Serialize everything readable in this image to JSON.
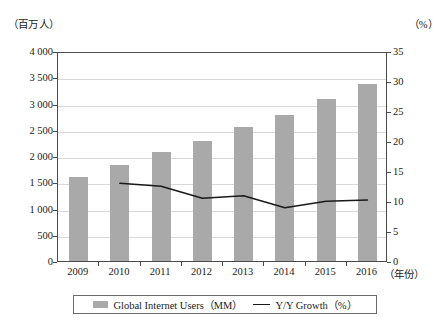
{
  "chart_data": {
    "type": "bar",
    "title": "",
    "xlabel": "年份",
    "ylabel": "（百万人）",
    "y2label": "（%）",
    "categories": [
      "2009",
      "2010",
      "2011",
      "2012",
      "2013",
      "2014",
      "2015",
      "2016"
    ],
    "grid": true,
    "legend_position": "bottom",
    "ylim": [
      0,
      4000
    ],
    "y2lim": [
      0,
      35
    ],
    "yticks": [
      "0",
      "500",
      "1 000",
      "1 500",
      "2 000",
      "2 500",
      "3 000",
      "3 500",
      "4 000"
    ],
    "ytick_values": [
      0,
      500,
      1000,
      1500,
      2000,
      2500,
      3000,
      3500,
      4000
    ],
    "y2ticks": [
      "0",
      "5",
      "10",
      "15",
      "20",
      "25",
      "30",
      "35"
    ],
    "y2tick_values": [
      0,
      5,
      10,
      15,
      20,
      25,
      30,
      35
    ],
    "series": [
      {
        "name": "Global Internet Users（MM）",
        "type": "bar",
        "axis": "left",
        "color": "#a9a9a9",
        "values": [
          1600,
          1830,
          2070,
          2290,
          2550,
          2780,
          3080,
          3380
        ]
      },
      {
        "name": "Y/Y Growth（%）",
        "type": "line",
        "axis": "right",
        "color": "#1a1a1a",
        "values": [
          null,
          13.3,
          12.8,
          10.8,
          11.2,
          9.2,
          10.3,
          10.5
        ]
      }
    ]
  },
  "axes": {
    "left_unit": "（百万人）",
    "right_unit": "（%）",
    "x_title": "（年份）"
  },
  "legend": {
    "items": [
      {
        "label": "Global Internet Users（MM）",
        "marker": "bar-swatch"
      },
      {
        "label": "Y/Y Growth（%）",
        "marker": "line-swatch"
      }
    ]
  },
  "caption": ""
}
